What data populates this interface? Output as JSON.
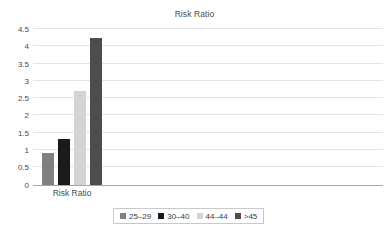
{
  "chart_data": {
    "type": "bar",
    "title": "Risk Ratio",
    "xlabel": "",
    "ylabel": "",
    "categories": [
      "Risk Ratio"
    ],
    "series": [
      {
        "name": "25–29",
        "values": [
          0.92
        ],
        "color": "#808080"
      },
      {
        "name": "30–40",
        "values": [
          1.32
        ],
        "color": "#1a1a1a"
      },
      {
        "name": "44–44",
        "values": [
          2.7
        ],
        "color": "#d3d3d3"
      },
      {
        "name": ">45",
        "values": [
          4.24
        ],
        "color": "#4d4d4d"
      }
    ],
    "ylim": [
      0,
      4.5
    ],
    "ytick_labels": [
      "4.5",
      "4",
      "3.5",
      "3",
      "2.5",
      "2",
      "1.5",
      "1",
      "0.5",
      "0"
    ],
    "ytick_values": [
      4.5,
      4,
      3.5,
      3,
      2.5,
      2,
      1.5,
      1,
      0.5,
      0
    ],
    "grid": true,
    "legend_position": "bottom"
  },
  "legend": {
    "items": [
      {
        "label": "25–29",
        "color": "#808080"
      },
      {
        "label": "30–40",
        "color": "#1a1a1a"
      },
      {
        "label": "44–44",
        "color": "#d3d3d3"
      },
      {
        "label": ">45",
        "color": "#4d4d4d"
      }
    ]
  },
  "colors": {
    "gridline": "#e2e2e2",
    "axis": "#a6a6a6",
    "text": "#4a4a4a",
    "plot_background": "#ffffff"
  }
}
